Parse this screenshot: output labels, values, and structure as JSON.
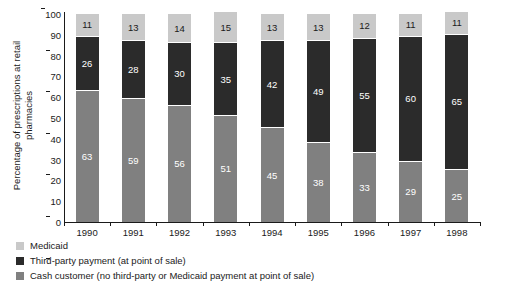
{
  "chart_data": {
    "type": "bar",
    "stacked": true,
    "title": "",
    "xlabel": "",
    "ylabel": "Percentage of prescriptions at retail pharmacies",
    "ylabel_lines": [
      "Percentage of prescriptions at retail",
      "pharmacies"
    ],
    "categories": [
      "1990",
      "1991",
      "1992",
      "1993",
      "1994",
      "1995",
      "1996",
      "1997",
      "1998"
    ],
    "series": [
      {
        "name": "Cash customer (no third-party or Medicaid payment at point of sale)",
        "color": "#808080",
        "label_color": "#ffffff",
        "values": [
          63,
          59,
          56,
          51,
          45,
          38,
          33,
          29,
          25
        ]
      },
      {
        "name": "Third-party payment (at point of sale)",
        "color": "#2b2b2b",
        "label_color": "#ffffff",
        "values": [
          26,
          28,
          30,
          35,
          42,
          49,
          55,
          60,
          65
        ]
      },
      {
        "name": "Medicaid",
        "color": "#c9c9c9",
        "label_color": "#1a1a1a",
        "values": [
          11,
          13,
          14,
          15,
          13,
          13,
          12,
          11,
          11
        ]
      }
    ],
    "ylim": [
      0,
      100
    ],
    "yticks": [
      "0",
      "10",
      "20",
      "30",
      "40",
      "50",
      "60",
      "70",
      "80",
      "90",
      "100"
    ],
    "grid": false,
    "legend_position": "bottom-left",
    "legend": [
      {
        "label": "Medicaid",
        "color": "#c9c9c9"
      },
      {
        "label": "Third-party payment (at point of sale)",
        "color": "#2b2b2b"
      },
      {
        "label": "Cash customer (no third-party or Medicaid payment at point of sale)",
        "color": "#808080"
      }
    ]
  }
}
